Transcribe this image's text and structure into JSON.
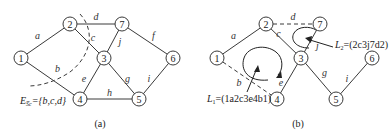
{
  "panels": [
    {
      "id": "a",
      "caption": "(a)",
      "nodes": [
        "1",
        "2",
        "3",
        "4",
        "5",
        "6",
        "7"
      ],
      "edges": [
        {
          "label": "a",
          "from": "1",
          "to": "2",
          "style": "solid"
        },
        {
          "label": "b",
          "from": "1",
          "to": "4",
          "style": "solid"
        },
        {
          "label": "c",
          "from": "2",
          "to": "3",
          "style": "solid"
        },
        {
          "label": "d",
          "from": "2",
          "to": "7",
          "style": "solid"
        },
        {
          "label": "e",
          "from": "4",
          "to": "3",
          "style": "solid"
        },
        {
          "label": "f",
          "from": "7",
          "to": "6",
          "style": "solid"
        },
        {
          "label": "g",
          "from": "3",
          "to": "5",
          "style": "solid"
        },
        {
          "label": "h",
          "from": "4",
          "to": "5",
          "style": "solid"
        },
        {
          "label": "i",
          "from": "5",
          "to": "6",
          "style": "solid"
        },
        {
          "label": "j",
          "from": "3",
          "to": "7",
          "style": "solid"
        }
      ],
      "cutset_label_main": "E",
      "cutset_label_sub": "S̅c",
      "cutset_label_value": "={b,c,d}"
    },
    {
      "id": "b",
      "caption": "(b)",
      "nodes": [
        "1",
        "2",
        "3",
        "4",
        "5",
        "6",
        "7"
      ],
      "edges": [
        {
          "label": "a",
          "from": "1",
          "to": "2",
          "style": "solid"
        },
        {
          "label": "b",
          "from": "1",
          "to": "4",
          "style": "dashed"
        },
        {
          "label": "c",
          "from": "2",
          "to": "3",
          "style": "solid"
        },
        {
          "label": "d",
          "from": "2",
          "to": "7",
          "style": "dashed"
        },
        {
          "label": "e",
          "from": "4",
          "to": "3",
          "style": "solid"
        },
        {
          "label": "g",
          "from": "3",
          "to": "5",
          "style": "solid"
        },
        {
          "label": "i",
          "from": "5",
          "to": "6",
          "style": "solid"
        },
        {
          "label": "j",
          "from": "3",
          "to": "7",
          "style": "solid"
        }
      ],
      "loops": [
        {
          "name_main": "L",
          "name_sub": "1",
          "value": "=(1a2c3e4b1)"
        },
        {
          "name_main": "L",
          "name_sub": "2",
          "value": "=(2c3j7d2)"
        }
      ]
    }
  ]
}
